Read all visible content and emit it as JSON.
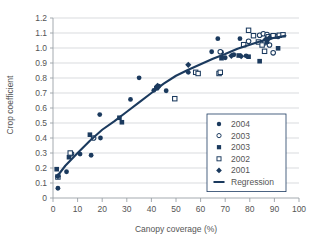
{
  "chart_data": {
    "type": "scatter",
    "title": "",
    "xlabel": "Canopy coverage (%)",
    "ylabel": "Crop coefficient",
    "xlim": [
      0,
      100
    ],
    "ylim": [
      0,
      1.2
    ],
    "xticks": [
      0,
      10,
      20,
      30,
      40,
      50,
      60,
      70,
      80,
      90,
      100
    ],
    "yticks": [
      0,
      0.1,
      0.2,
      0.3,
      0.4,
      0.5,
      0.6,
      0.7,
      0.8,
      0.9,
      1.0,
      1.1,
      1.2
    ],
    "xtick_labels": [
      "0",
      "10",
      "20",
      "30",
      "40",
      "50",
      "60",
      "70",
      "80",
      "90",
      "100"
    ],
    "ytick_labels": [
      "0",
      "0.1",
      "0.2",
      "0.3",
      "0.4",
      "0.5",
      "0.6",
      "0.7",
      "0.8",
      "0.9",
      "1.0",
      "1.1",
      "1.2"
    ],
    "grid": "horizontal",
    "legend_position": "inside-lower-right",
    "accent_color": "#1b3a5e",
    "grid_color": "#c8ccd0",
    "series": [
      {
        "name": "2004",
        "marker": "filled-circle",
        "color": "#1b3a5e",
        "points": [
          [
            2.0,
            0.065
          ],
          [
            5.5,
            0.175
          ],
          [
            11.0,
            0.293
          ],
          [
            15.5,
            0.285
          ],
          [
            19.0,
            0.556
          ],
          [
            19.3,
            0.4
          ],
          [
            31.5,
            0.657
          ],
          [
            35.0,
            0.801
          ],
          [
            41.0,
            0.718
          ],
          [
            42.5,
            0.735
          ],
          [
            43.0,
            0.745
          ],
          [
            46.0,
            0.715
          ],
          [
            55.0,
            0.838
          ],
          [
            64.5,
            0.975
          ],
          [
            67.0,
            1.062
          ],
          [
            68.5,
            0.972
          ],
          [
            70.0,
            0.935
          ],
          [
            73.5,
            0.955
          ],
          [
            76.0,
            1.062
          ],
          [
            78.5,
            0.948
          ]
        ]
      },
      {
        "name": "2003",
        "marker": "open-circle",
        "color": "#1b3a5e",
        "points": [
          [
            7.5,
            0.295
          ],
          [
            16.5,
            0.4
          ],
          [
            68.0,
            0.975
          ],
          [
            79.5,
            1.045
          ],
          [
            84.0,
            1.085
          ],
          [
            85.5,
            1.095
          ],
          [
            86.0,
            1.035
          ],
          [
            87.0,
            1.09
          ],
          [
            88.0,
            1.02
          ],
          [
            88.5,
            1.075
          ],
          [
            89.5,
            0.968
          ],
          [
            90.5,
            1.08
          ],
          [
            91.5,
            1.078
          ]
        ]
      },
      {
        "name": "2003",
        "marker": "filled-square",
        "color": "#1b3a5e",
        "points": [
          [
            1.5,
            0.192
          ],
          [
            6.5,
            0.272
          ],
          [
            15.0,
            0.422
          ],
          [
            27.0,
            0.535
          ],
          [
            28.0,
            0.505
          ],
          [
            42.0,
            0.732
          ],
          [
            68.5,
            0.932
          ],
          [
            75.5,
            0.95
          ],
          [
            79.5,
            0.942
          ],
          [
            84.0,
            0.912
          ],
          [
            87.0,
            1.042
          ],
          [
            91.5,
            0.998
          ]
        ]
      },
      {
        "name": "2002",
        "marker": "open-square",
        "color": "#1b3a5e",
        "points": [
          [
            2.0,
            0.14
          ],
          [
            7.0,
            0.3
          ],
          [
            49.5,
            0.662
          ],
          [
            58.0,
            0.838
          ],
          [
            59.0,
            0.83
          ],
          [
            67.5,
            0.83
          ],
          [
            68.0,
            0.838
          ],
          [
            77.5,
            1.022
          ],
          [
            79.5,
            1.118
          ],
          [
            81.5,
            1.082
          ],
          [
            83.5,
            1.04
          ],
          [
            85.0,
            1.02
          ],
          [
            86.0,
            0.978
          ],
          [
            87.5,
            1.075
          ],
          [
            89.5,
            1.082
          ],
          [
            92.0,
            1.085
          ],
          [
            93.5,
            1.088
          ]
        ]
      },
      {
        "name": "2001",
        "marker": "filled-diamond",
        "color": "#1b3a5e",
        "points": [
          [
            2.0,
            0.145
          ],
          [
            42.5,
            0.748
          ],
          [
            55.0,
            0.888
          ],
          [
            72.5,
            0.948
          ],
          [
            76.5,
            0.945
          ],
          [
            86.5,
            1.058
          ],
          [
            88.0,
            1.068
          ]
        ]
      }
    ],
    "regression": {
      "name": "Regression",
      "marker": "line",
      "color": "#1b3a5e",
      "points": [
        [
          1.5,
          0.14
        ],
        [
          5.0,
          0.215
        ],
        [
          10.0,
          0.3
        ],
        [
          15.0,
          0.382
        ],
        [
          20.0,
          0.455
        ],
        [
          25.0,
          0.512
        ],
        [
          30.0,
          0.575
        ],
        [
          35.0,
          0.638
        ],
        [
          40.0,
          0.7
        ],
        [
          45.0,
          0.762
        ],
        [
          50.0,
          0.815
        ],
        [
          55.0,
          0.855
        ],
        [
          60.0,
          0.892
        ],
        [
          65.0,
          0.928
        ],
        [
          70.0,
          0.96
        ],
        [
          75.0,
          0.995
        ],
        [
          80.0,
          1.022
        ],
        [
          85.0,
          1.048
        ],
        [
          90.0,
          1.068
        ],
        [
          94.5,
          1.082
        ]
      ]
    },
    "legend_entries": [
      {
        "label": "2004",
        "marker": "filled-circle"
      },
      {
        "label": "2003",
        "marker": "open-circle"
      },
      {
        "label": "2003",
        "marker": "filled-square"
      },
      {
        "label": "2002",
        "marker": "open-square"
      },
      {
        "label": "2001",
        "marker": "filled-diamond"
      },
      {
        "label": "Regression",
        "marker": "line"
      }
    ]
  }
}
